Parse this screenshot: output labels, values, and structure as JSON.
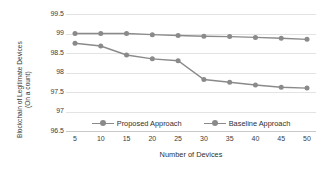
{
  "chart_data": {
    "type": "line",
    "title": "",
    "xlabel": "Number of Devices",
    "ylabel_line1": "Blockchain of Legitimate Devices",
    "ylabel_line2": "(On a count)",
    "x": [
      5,
      10,
      15,
      20,
      25,
      30,
      35,
      40,
      45,
      50
    ],
    "xtick_labels": [
      "5",
      "10",
      "15",
      "20",
      "25",
      "30",
      "35",
      "40",
      "45",
      "50"
    ],
    "ytick_labels": [
      "99.5",
      "99",
      "98.5",
      "98",
      "97.5",
      "97",
      "96.5"
    ],
    "ytick_values": [
      99.5,
      99,
      98.5,
      98,
      97.5,
      97,
      96.5
    ],
    "ylim": [
      96.5,
      99.5
    ],
    "xlim": [
      5,
      50
    ],
    "grid": "horizontal",
    "legend_position": "bottom-center",
    "series": [
      {
        "name": "Proposed Approach",
        "color": "#8a8a8a",
        "marker": "circle",
        "values": [
          99.0,
          99.0,
          99.0,
          98.97,
          98.95,
          98.93,
          98.92,
          98.9,
          98.88,
          98.85
        ]
      },
      {
        "name": "Baseline Approach",
        "color": "#8a8a8a",
        "marker": "circle",
        "values": [
          98.75,
          98.68,
          98.45,
          98.35,
          98.3,
          97.82,
          97.75,
          97.68,
          97.62,
          97.6
        ]
      }
    ]
  },
  "legend": {
    "items": [
      {
        "label": "Proposed Approach"
      },
      {
        "label": "Baseline Approach"
      }
    ]
  }
}
